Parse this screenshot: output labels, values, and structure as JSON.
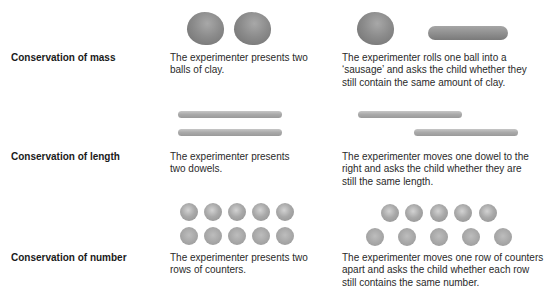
{
  "rows": [
    {
      "label": "Conservation of mass",
      "initial": {
        "description": "The experimenter presents two balls of clay.",
        "line1": "The experimenter presents two",
        "line2": "balls of clay."
      },
      "transformed": {
        "description": "The experimenter rolls one ball into a 'sausage' and asks the child whether they still contain the same amount of clay.",
        "line1": "The experimenter rolls one ball into a",
        "line2": "‘sausage’ and asks the child whether they",
        "line3": "still contain the same amount of clay."
      },
      "illustration": {
        "initial": [
          "clay-ball",
          "clay-ball"
        ],
        "transformed": [
          "clay-ball",
          "clay-sausage"
        ]
      }
    },
    {
      "label": "Conservation of length",
      "initial": {
        "line1": "The experimenter presents",
        "line2": "two dowels."
      },
      "transformed": {
        "line1": "The experimenter moves one dowel to the",
        "line2": "right and asks the child whether they are",
        "line3": "still the same length."
      },
      "illustration": {
        "initial": [
          "dowel",
          "dowel"
        ],
        "transformed": [
          "dowel",
          "dowel-shifted-right"
        ]
      }
    },
    {
      "label": "Conservation of number",
      "initial": {
        "line1": "The experimenter presents two",
        "line2": "rows of counters."
      },
      "transformed": {
        "line1": "The experimenter moves one row of counters",
        "line2": "apart and asks the child whether each row",
        "line3": "still contains the same number."
      },
      "illustration": {
        "initial": {
          "top_row_count": 5,
          "bottom_row_count": 5
        },
        "transformed": {
          "top_row_count": 5,
          "bottom_row_count": 5,
          "bottom_row": "spread apart"
        }
      }
    }
  ],
  "colors": {
    "clay": "#8c8c8c",
    "dowel": "#aaaaaa",
    "counter": "#a9a9a9",
    "text": "#2a2a2a"
  }
}
